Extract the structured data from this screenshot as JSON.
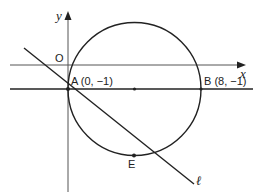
{
  "diagram": {
    "axes": {
      "x_label": "x",
      "y_label": "y",
      "origin_label": "O"
    },
    "points": {
      "A": {
        "label": "A (0, −1)",
        "coords": [
          0,
          -1
        ]
      },
      "B": {
        "label": "B (8, −1)",
        "coords": [
          8,
          -1
        ]
      },
      "E": {
        "label": "E"
      },
      "center": {
        "label": ""
      }
    },
    "line": {
      "label": "ℓ"
    },
    "horizontal_line": {
      "equation": "y = -1"
    },
    "colors": {
      "stroke": "#222222",
      "axis": "#555555"
    }
  }
}
